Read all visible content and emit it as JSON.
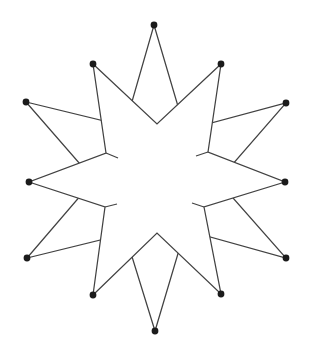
{
  "figure": {
    "kind": "geometric-star-diagram",
    "canvas": {
      "width": 314,
      "height": 352,
      "background": "#ffffff"
    },
    "style": {
      "line_color": "#424242",
      "line_width": 1.25,
      "dot_color": "#1b1b1b",
      "dot_radius": 3.4,
      "front_star_fill": "#ffffff"
    },
    "back_star": {
      "points": [
        [
          154,
          25
        ],
        [
          185,
          130
        ],
        [
          286,
          103
        ],
        [
          218,
          181
        ],
        [
          286,
          258
        ],
        [
          185,
          230
        ],
        [
          155,
          331
        ],
        [
          125,
          234
        ],
        [
          27,
          258
        ],
        [
          94,
          180
        ],
        [
          26,
          102
        ],
        [
          125,
          126
        ]
      ]
    },
    "front_star": {
      "points": [
        [
          221,
          64
        ],
        [
          208,
          152
        ],
        [
          285,
          182
        ],
        [
          204,
          207
        ],
        [
          221,
          294
        ],
        [
          157,
          233
        ],
        [
          93,
          295
        ],
        [
          105,
          207
        ],
        [
          29,
          182
        ],
        [
          106,
          153
        ],
        [
          93,
          64
        ],
        [
          157,
          124
        ]
      ]
    },
    "artifact_segments": [
      [
        [
          106,
          153
        ],
        [
          118,
          158
        ]
      ],
      [
        [
          208,
          152
        ],
        [
          196,
          156
        ]
      ],
      [
        [
          204,
          207
        ],
        [
          192,
          203
        ]
      ],
      [
        [
          105,
          207
        ],
        [
          117,
          204
        ]
      ]
    ],
    "vertex_dots": [
      [
        154,
        25
      ],
      [
        221,
        64
      ],
      [
        286,
        103
      ],
      [
        285,
        182
      ],
      [
        286,
        258
      ],
      [
        221,
        294
      ],
      [
        155,
        331
      ],
      [
        93,
        295
      ],
      [
        27,
        258
      ],
      [
        29,
        182
      ],
      [
        26,
        102
      ],
      [
        93,
        64
      ]
    ]
  }
}
